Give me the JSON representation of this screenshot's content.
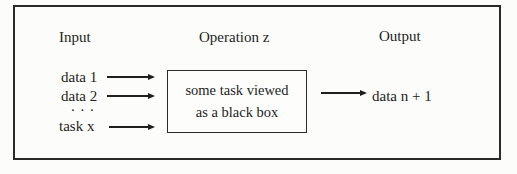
{
  "figure": {
    "headers": {
      "input": "Input",
      "operation": "Operation z",
      "output": "Output"
    },
    "inputs": [
      {
        "label": "data 1"
      },
      {
        "label": "data 2"
      },
      {
        "label": ". . ."
      },
      {
        "label": "task x"
      }
    ],
    "black_box": {
      "line1": "some task viewed",
      "line2": "as a black box"
    },
    "output": {
      "label": "data n + 1"
    }
  },
  "icons": {
    "input_arrow_1": "right-arrow",
    "input_arrow_2": "right-arrow",
    "input_arrow_3": "right-arrow",
    "output_arrow": "right-arrow"
  },
  "colors": {
    "ink": "#1e1e1c",
    "border": "#2a2a28",
    "bg": "#fcfcfa",
    "box_bg": "#fdfdfc"
  }
}
